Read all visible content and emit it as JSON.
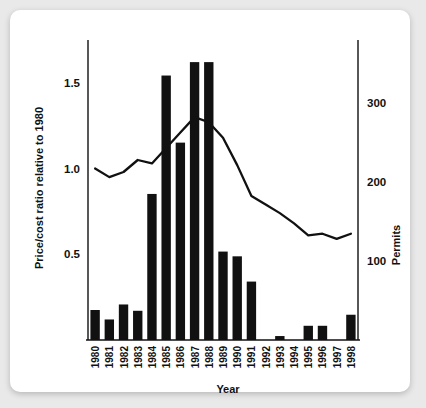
{
  "chart_data": {
    "type": "bar",
    "title": "",
    "xlabel": "Year",
    "ylabel": "Price/cost ratio relative to 1980",
    "y2label": "Permits",
    "grid": false,
    "legend": "none",
    "categories": [
      "1980",
      "1981",
      "1982",
      "1983",
      "1984",
      "1985",
      "1986",
      "1987",
      "1988",
      "1989",
      "1990",
      "1991",
      "1992",
      "1993",
      "1994",
      "1995",
      "1996",
      "1997",
      "1998"
    ],
    "ylim": [
      0,
      1.75
    ],
    "y2lim": [
      0,
      380
    ],
    "yticks": [
      "1.5",
      "1.0",
      "0.5"
    ],
    "ytick_values": [
      1.5,
      1.0,
      0.5
    ],
    "y2ticks": [
      "300",
      "200",
      "100"
    ],
    "y2tick_values": [
      300,
      200,
      100
    ],
    "series": [
      {
        "name": "Permits",
        "type": "bar",
        "axis": "right",
        "color": "#111111",
        "values": [
          38,
          26,
          45,
          37,
          185,
          335,
          250,
          352,
          352,
          112,
          106,
          74,
          0,
          5,
          0,
          18,
          18,
          0,
          32
        ]
      },
      {
        "name": "Price/cost ratio relative to 1980",
        "type": "line",
        "axis": "left",
        "color": "#111111",
        "values": [
          1.0,
          0.95,
          0.98,
          1.05,
          1.03,
          1.12,
          1.21,
          1.3,
          1.27,
          1.18,
          1.02,
          0.84,
          0.79,
          0.74,
          0.68,
          0.61,
          0.62,
          0.59,
          0.62
        ]
      }
    ]
  },
  "axes": {
    "y_left_title": "Price/cost ratio relative to 1980",
    "y_right_title": "Permits",
    "x_title": "Year"
  }
}
